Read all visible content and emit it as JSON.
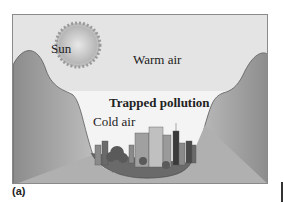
{
  "figure": {
    "panel_label": "(a)",
    "labels": {
      "sun": "Sun",
      "warm_air": "Warm air",
      "trapped_pollution": "Trapped pollution",
      "cold_air": "Cold air"
    },
    "colors": {
      "sky": "#e4e4e4",
      "inversion_layer": "#f4f4f4",
      "mountain": "#9a9a9a",
      "mountain_outline": "#5a5a5a",
      "sun": "#c9c9c9",
      "buildings": "#7a7a7a"
    }
  }
}
